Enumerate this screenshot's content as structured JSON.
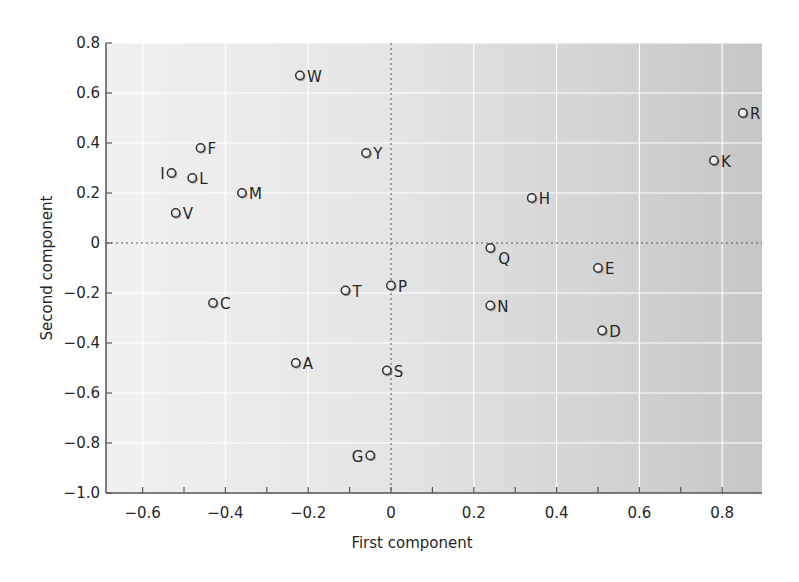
{
  "chart_data": {
    "type": "scatter",
    "title": "",
    "xlabel": "First component",
    "ylabel": "Second component",
    "xlim": [
      -0.69,
      0.9
    ],
    "ylim": [
      -1.0,
      0.8
    ],
    "x_ticks": [
      -0.6,
      -0.4,
      -0.2,
      0,
      0.2,
      0.4,
      0.6,
      0.8
    ],
    "x_tick_labels": [
      "−0.6",
      "−0.4",
      "−0.2",
      "0",
      "0.2",
      "0.4",
      "0.6",
      "0.8"
    ],
    "x_minor_ticks": [
      -0.6,
      -0.5,
      -0.4,
      -0.3,
      -0.2,
      -0.1,
      0,
      0.1,
      0.2,
      0.3,
      0.4,
      0.5,
      0.6,
      0.7,
      0.8,
      0.9
    ],
    "y_ticks": [
      -1.0,
      -0.8,
      -0.6,
      -0.4,
      -0.2,
      0,
      0.2,
      0.4,
      0.6,
      0.8
    ],
    "y_tick_labels": [
      "−1.0",
      "−0.8",
      "−0.6",
      "−0.4",
      "−0.2",
      "0",
      "0.2",
      "0.4",
      "0.6",
      "0.8"
    ],
    "grid": true,
    "reference_lines": {
      "x": 0,
      "y": 0,
      "style": "dotted"
    },
    "legend": null,
    "series": [
      {
        "name": "Amino acids",
        "points": [
          {
            "label": "A",
            "x": -0.23,
            "y": -0.48,
            "label_side": "right"
          },
          {
            "label": "C",
            "x": -0.43,
            "y": -0.24,
            "label_side": "right"
          },
          {
            "label": "D",
            "x": 0.51,
            "y": -0.35,
            "label_side": "right"
          },
          {
            "label": "E",
            "x": 0.5,
            "y": -0.1,
            "label_side": "right"
          },
          {
            "label": "F",
            "x": -0.46,
            "y": 0.38,
            "label_side": "right"
          },
          {
            "label": "G",
            "x": -0.05,
            "y": -0.85,
            "label_side": "left"
          },
          {
            "label": "H",
            "x": 0.34,
            "y": 0.18,
            "label_side": "right"
          },
          {
            "label": "I",
            "x": -0.53,
            "y": 0.28,
            "label_side": "left"
          },
          {
            "label": "K",
            "x": 0.78,
            "y": 0.33,
            "label_side": "right"
          },
          {
            "label": "L",
            "x": -0.48,
            "y": 0.26,
            "label_side": "right"
          },
          {
            "label": "M",
            "x": -0.36,
            "y": 0.2,
            "label_side": "right"
          },
          {
            "label": "N",
            "x": 0.24,
            "y": -0.25,
            "label_side": "right"
          },
          {
            "label": "P",
            "x": 0.0,
            "y": -0.17,
            "label_side": "right"
          },
          {
            "label": "Q",
            "x": 0.24,
            "y": -0.02,
            "label_side": "right-below"
          },
          {
            "label": "R",
            "x": 0.85,
            "y": 0.52,
            "label_side": "right"
          },
          {
            "label": "S",
            "x": -0.01,
            "y": -0.51,
            "label_side": "right"
          },
          {
            "label": "T",
            "x": -0.11,
            "y": -0.19,
            "label_side": "right"
          },
          {
            "label": "V",
            "x": -0.52,
            "y": 0.12,
            "label_side": "right"
          },
          {
            "label": "W",
            "x": -0.22,
            "y": 0.67,
            "label_side": "right"
          },
          {
            "label": "Y",
            "x": -0.06,
            "y": 0.36,
            "label_side": "right"
          }
        ]
      }
    ],
    "colors": {
      "background_left": "#f1f1f1",
      "background_right": "#c6c6c6",
      "grid": "#ffffff",
      "axis": "#555555",
      "marker_fill": "#ffffff",
      "marker_stroke": "#333333",
      "text": "#262626"
    }
  }
}
